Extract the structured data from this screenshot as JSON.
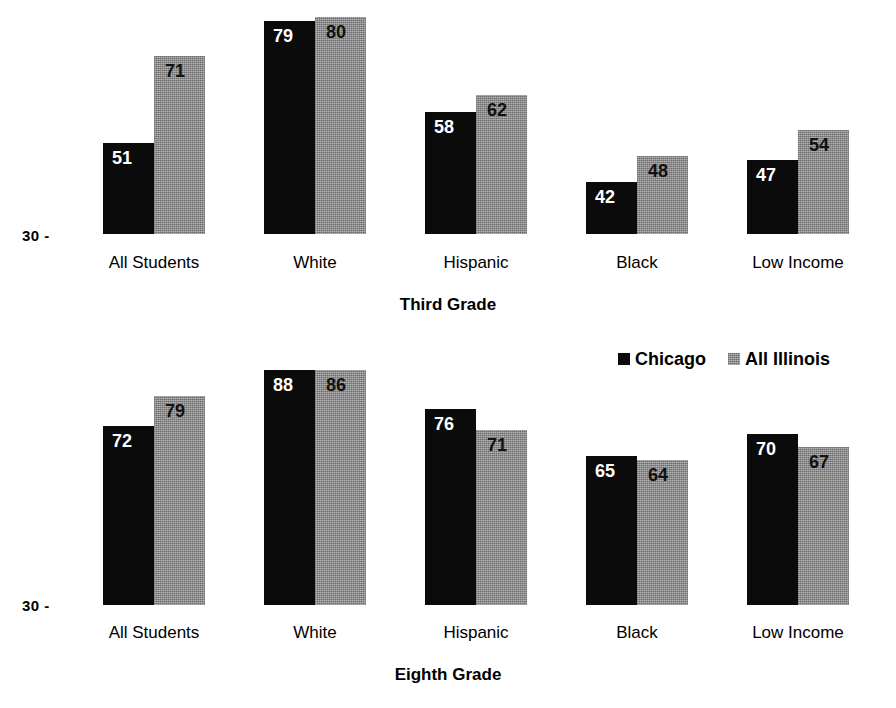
{
  "chart_data": [
    {
      "type": "bar",
      "title": "Third Grade",
      "panel_id": "third-grade",
      "categories": [
        "All Students",
        "White",
        "Hispanic",
        "Black",
        "Low Income"
      ],
      "series": [
        {
          "name": "Chicago",
          "color": "#0b0b0b",
          "values": [
            51,
            79,
            58,
            42,
            47
          ]
        },
        {
          "name": "All Illinois",
          "color": "#8b8b8b",
          "values": [
            71,
            80,
            62,
            48,
            54
          ]
        }
      ],
      "xlabel": "Third Grade",
      "ylabel": "",
      "ylim": [
        30,
        81
      ],
      "y_axis_origin_label": "30 -",
      "grid": false,
      "legend_position": "middle-right"
    },
    {
      "type": "bar",
      "title": "Eighth Grade",
      "panel_id": "eighth-grade",
      "categories": [
        "All Students",
        "White",
        "Hispanic",
        "Black",
        "Low Income"
      ],
      "series": [
        {
          "name": "Chicago",
          "color": "#0b0b0b",
          "values": [
            72,
            88,
            76,
            65,
            70
          ]
        },
        {
          "name": "All Illinois",
          "color": "#8b8b8b",
          "values": [
            79,
            86,
            71,
            64,
            67
          ]
        }
      ],
      "xlabel": "Eighth Grade",
      "ylabel": "",
      "ylim": [
        30,
        89
      ],
      "y_axis_origin_label": "30 -",
      "grid": false,
      "legend_position": "middle-right"
    }
  ],
  "legend": {
    "items": [
      {
        "label": "Chicago",
        "swatch": "chicago-swatch-icon"
      },
      {
        "label": "All Illinois",
        "swatch": "illinois-swatch-icon"
      }
    ]
  }
}
